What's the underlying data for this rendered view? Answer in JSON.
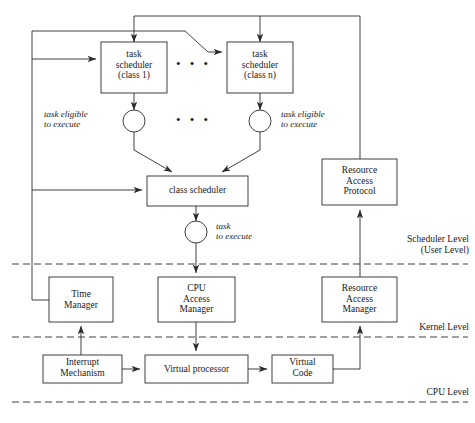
{
  "diagram": {
    "stroke_color": "#2b2b2b",
    "text_color": "#1a1a1a",
    "background_color": "#ffffff",
    "boxes": [
      {
        "id": "task-scheduler-class-1",
        "lines": [
          "task",
          "scheduler",
          "(class 1)"
        ],
        "x": 101,
        "y": 42,
        "w": 66,
        "h": 51
      },
      {
        "id": "task-scheduler-class-n",
        "lines": [
          "task",
          "scheduler",
          "(class n)"
        ],
        "x": 227,
        "y": 42,
        "w": 66,
        "h": 51
      },
      {
        "id": "class-scheduler",
        "lines": [
          "class scheduler"
        ],
        "x": 147,
        "y": 176,
        "w": 101,
        "h": 30
      },
      {
        "id": "resource-access-protocol",
        "lines": [
          "Resource",
          "Access",
          "Protocol"
        ],
        "x": 322,
        "y": 159,
        "w": 75,
        "h": 46
      },
      {
        "id": "time-manager",
        "lines": [
          "Time",
          "Manager"
        ],
        "x": 49,
        "y": 277,
        "w": 64,
        "h": 45
      },
      {
        "id": "cpu-access-manager",
        "lines": [
          "CPU",
          "Access",
          "Manager"
        ],
        "x": 158,
        "y": 277,
        "w": 77,
        "h": 45
      },
      {
        "id": "resource-access-manager",
        "lines": [
          "Resource",
          "Access",
          "Manager"
        ],
        "x": 322,
        "y": 277,
        "w": 75,
        "h": 45
      },
      {
        "id": "interrupt-mechanism",
        "lines": [
          "Interrupt",
          "Mechanism"
        ],
        "x": 43,
        "y": 355,
        "w": 79,
        "h": 28
      },
      {
        "id": "virtual-processor",
        "lines": [
          "Virtual processor"
        ],
        "x": 145,
        "y": 355,
        "w": 103,
        "h": 28
      },
      {
        "id": "virtual-code",
        "lines": [
          "Virtual",
          "Code"
        ],
        "x": 272,
        "y": 355,
        "w": 61,
        "h": 28
      }
    ],
    "circles": [
      {
        "id": "task-eligible-circle-class-1",
        "cx": 134,
        "cy": 121,
        "r": 11
      },
      {
        "id": "task-eligible-circle-class-n",
        "cx": 260,
        "cy": 121,
        "r": 11
      },
      {
        "id": "task-to-execute-circle",
        "cx": 196,
        "cy": 232,
        "r": 11
      }
    ],
    "annotations": [
      {
        "id": "task-eligible-left",
        "lines": [
          "task eligible",
          "to execute"
        ],
        "x": 48,
        "y": 109,
        "align": "left"
      },
      {
        "id": "task-eligible-right",
        "lines": [
          "task eligible",
          "to execute"
        ],
        "x": 281,
        "y": 109,
        "align": "left"
      },
      {
        "id": "task-to-execute",
        "lines": [
          "task",
          "to execute"
        ],
        "x": 215,
        "y": 221,
        "align": "left"
      }
    ],
    "level_labels": [
      {
        "id": "scheduler-level",
        "lines": [
          "Scheduler Level",
          "(User Level)"
        ],
        "right": 6,
        "y": 234
      },
      {
        "id": "kernel-level",
        "lines": [
          "Kernel Level"
        ],
        "right": 6,
        "y": 322
      },
      {
        "id": "cpu-level",
        "lines": [
          "CPU Level"
        ],
        "right": 6,
        "y": 387
      }
    ],
    "level_divider_lines": [
      {
        "id": "scheduler-kernel-divider",
        "y": 264
      },
      {
        "id": "kernel-cpu-divider",
        "y": 337
      },
      {
        "id": "cpu-level-divider",
        "y": 402
      }
    ],
    "ellipsis_markers": [
      {
        "id": "ellipsis-schedulers",
        "x": 181,
        "y": 61,
        "text": "• • •"
      },
      {
        "id": "ellipsis-circles",
        "x": 181,
        "y": 114,
        "text": "• • •"
      }
    ]
  }
}
